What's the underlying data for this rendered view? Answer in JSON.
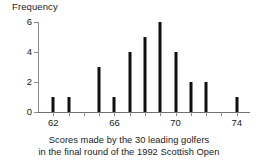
{
  "chart_data": {
    "type": "bar",
    "title": "",
    "caption_line_1": "Scores made by the 30 leading golfers",
    "caption_line_2": "in the final round of the 1992 Scottish Open",
    "xlabel": "",
    "ylabel": "Frequency",
    "categories": [
      62,
      63,
      64,
      65,
      66,
      67,
      68,
      69,
      70,
      71,
      72,
      73,
      74
    ],
    "values": [
      1,
      1,
      0,
      3,
      1,
      4,
      5,
      6,
      4,
      2,
      2,
      0,
      1
    ],
    "xlim": [
      61,
      75
    ],
    "ylim": [
      0,
      6
    ],
    "xticks": [
      62,
      63,
      64,
      65,
      66,
      67,
      68,
      69,
      70,
      71,
      72,
      73,
      74
    ],
    "xtick_labels_shown": [
      {
        "value": 62,
        "label": "62"
      },
      {
        "value": 66,
        "label": "66"
      },
      {
        "value": 70,
        "label": "70"
      },
      {
        "value": 74,
        "label": "74"
      }
    ],
    "yticks": [
      0,
      2,
      4,
      6
    ],
    "ytick_labels": [
      "0",
      "2",
      "4",
      "6"
    ],
    "grid": false,
    "legend": false,
    "bar_color": "#101010",
    "axis_color": "#8a8a8a",
    "background": "#ffffff"
  }
}
